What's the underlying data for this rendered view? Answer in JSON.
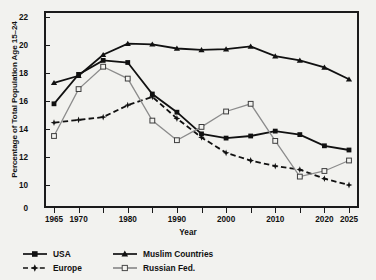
{
  "chart_data": {
    "type": "line",
    "title": "",
    "xlabel": "Year",
    "ylabel": "Percentage of Total Population Age 15–24",
    "x": [
      1965,
      1970,
      1975,
      1980,
      1985,
      1990,
      1995,
      2000,
      2005,
      2010,
      2015,
      2020,
      2025
    ],
    "xlim": [
      1963,
      2026
    ],
    "ylim": [
      10,
      22
    ],
    "y_axis_break": true,
    "y_zero_label": "0",
    "ytick_labels": [
      "0",
      "10",
      "12",
      "14",
      "16",
      "18",
      "20",
      "22"
    ],
    "ytick_values": [
      0,
      10,
      12,
      14,
      16,
      18,
      20,
      22
    ],
    "xtick_labels": [
      "1965",
      "1970",
      "1980",
      "1990",
      "2000",
      "2010",
      "2020",
      "2025"
    ],
    "xtick_values": [
      1965,
      1970,
      1980,
      1990,
      2000,
      2010,
      2020,
      2025
    ],
    "xminor_values": [
      1975,
      1985,
      1995,
      2005,
      2015
    ],
    "grid": false,
    "legend_position": "below-left",
    "series": [
      {
        "name": "USA",
        "color": "#111111",
        "marker": "filled-square",
        "dash": "solid",
        "values": [
          15.8,
          17.9,
          18.9,
          18.75,
          16.5,
          15.2,
          13.65,
          13.35,
          13.5,
          13.85,
          13.6,
          12.8,
          12.5
        ]
      },
      {
        "name": "Europe",
        "color": "#111111",
        "marker": "star",
        "dash": "dashed",
        "values": [
          14.45,
          14.65,
          14.85,
          15.7,
          16.3,
          14.75,
          13.4,
          12.3,
          11.75,
          11.35,
          11.1,
          10.45,
          10.0
        ]
      },
      {
        "name": "Muslim Countries",
        "color": "#111111",
        "marker": "filled-triangle",
        "dash": "solid",
        "values": [
          17.3,
          17.8,
          19.3,
          20.1,
          20.05,
          19.75,
          19.65,
          19.7,
          19.9,
          19.2,
          18.9,
          18.4,
          17.55
        ]
      },
      {
        "name": "Russian Fed.",
        "color": "#8c8c8c",
        "marker": "open-square",
        "dash": "solid",
        "values": [
          13.5,
          16.85,
          18.45,
          17.6,
          14.6,
          13.2,
          14.15,
          15.25,
          15.8,
          13.15,
          10.6,
          11.0,
          11.75
        ]
      }
    ]
  },
  "axes": {
    "y_title": "Percentage of Total Population Age 15–24",
    "x_title": "Year"
  },
  "legend": {
    "items": [
      {
        "label": "USA",
        "position": "row1-col1"
      },
      {
        "label": "Muslim Countries",
        "position": "row1-col2"
      },
      {
        "label": "Europe",
        "position": "row2-col1"
      },
      {
        "label": "Russian Fed.",
        "position": "row2-col2"
      }
    ]
  },
  "colors": {
    "background": "#f2f2ef",
    "axis": "#1b1b1b",
    "dark_series": "#111111",
    "gray_series": "#8c8c8c"
  }
}
